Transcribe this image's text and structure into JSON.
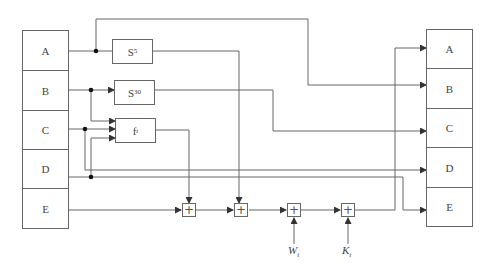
{
  "diagram": {
    "type": "block-diagram",
    "input_registers": [
      {
        "id": "in-A",
        "label": "A"
      },
      {
        "id": "in-B",
        "label": "B"
      },
      {
        "id": "in-C",
        "label": "C"
      },
      {
        "id": "in-D",
        "label": "D"
      },
      {
        "id": "in-E",
        "label": "E"
      }
    ],
    "output_registers": [
      {
        "id": "out-A",
        "label": "A"
      },
      {
        "id": "out-B",
        "label": "B"
      },
      {
        "id": "out-C",
        "label": "C"
      },
      {
        "id": "out-D",
        "label": "D"
      },
      {
        "id": "out-E",
        "label": "E"
      }
    ],
    "functions": {
      "s5": {
        "base": "S",
        "sup": "5"
      },
      "s30": {
        "base": "S",
        "sup": "30"
      },
      "ft": {
        "base": "f",
        "sub": "t"
      }
    },
    "adders": [
      {
        "id": "add1",
        "symbol": "+"
      },
      {
        "id": "add2",
        "symbol": "+"
      },
      {
        "id": "add3",
        "symbol": "+"
      },
      {
        "id": "add4",
        "symbol": "+"
      }
    ],
    "external_inputs": {
      "w": {
        "base": "W",
        "sub": "t"
      },
      "k": {
        "base": "K",
        "sub": "t"
      }
    },
    "colors": {
      "line": "#555555",
      "box_border": "#666666",
      "background": "#ffffff"
    }
  }
}
